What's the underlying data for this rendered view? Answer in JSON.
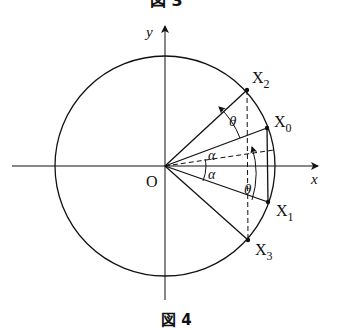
{
  "caption_top": "図 3",
  "caption": "図 4",
  "axes": {
    "x_label": "x",
    "y_label": "y",
    "origin_label": "O"
  },
  "points": [
    {
      "id": "X0",
      "base": "X",
      "sub": "0"
    },
    {
      "id": "X1",
      "base": "X",
      "sub": "1"
    },
    {
      "id": "X2",
      "base": "X",
      "sub": "2"
    },
    {
      "id": "X3",
      "base": "X",
      "sub": "3"
    }
  ],
  "angles": {
    "alpha_upper": "α",
    "alpha_lower": "α",
    "theta_upper": "θ",
    "theta_lower": "θ"
  },
  "colors": {
    "stroke": "#111111",
    "background": "#ffffff"
  }
}
